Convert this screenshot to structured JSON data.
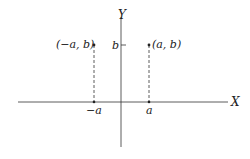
{
  "diagram": {
    "axes": {
      "x_label": "X",
      "y_label": "Y"
    },
    "points": [
      {
        "label": "(−a, b)",
        "x_tick": "−a"
      },
      {
        "label": "(a, b)",
        "x_tick": "a"
      }
    ],
    "y_tick": "b",
    "colors": {
      "ink": "#222222",
      "background": "#ffffff"
    }
  }
}
